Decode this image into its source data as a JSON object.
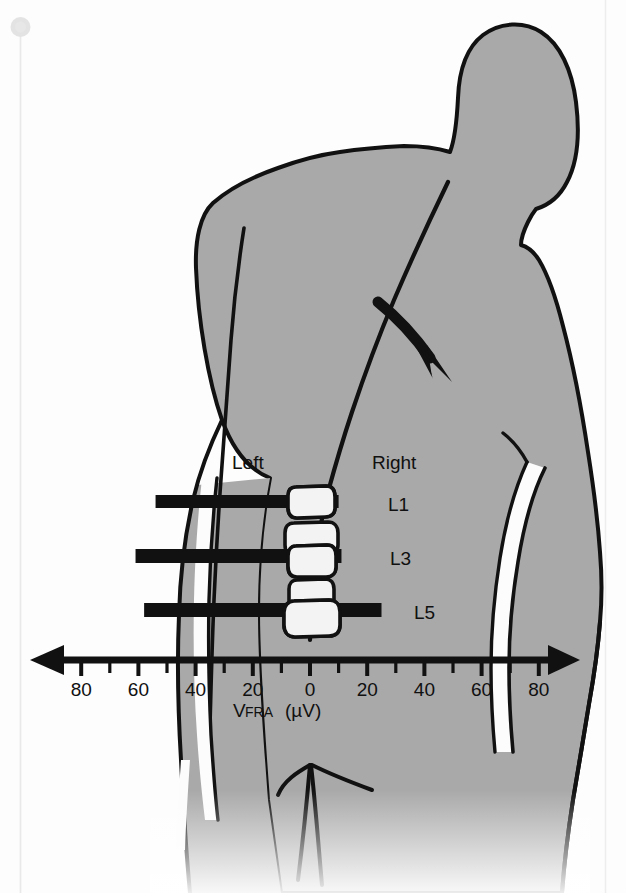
{
  "figure": {
    "kind": "anatomical-diagram-with-bar-chart",
    "body_fill": "#a9a9a9",
    "outline_color": "#111111",
    "vertebra_fill": "#f2f2f2",
    "bar_color": "#111111",
    "background": "#fdfdfd"
  },
  "labels": {
    "left": "Left",
    "right": "Right",
    "segments": [
      "L1",
      "L3",
      "L5"
    ]
  },
  "axis": {
    "title_main": "V",
    "title_sub": "FRA",
    "title_unit": "(µV)",
    "title_full": "VFRA (µV)",
    "tick_labels": [
      "80",
      "60",
      "40",
      "20",
      "0",
      "20",
      "40",
      "60",
      "80"
    ],
    "minor_tick_step": 10,
    "major_tick_step": 20
  },
  "chart_data": {
    "type": "bar",
    "orientation": "horizontal",
    "title": "",
    "xlabel": "VFRA (µV)",
    "ylabel": "",
    "xlim": [
      -90,
      90
    ],
    "xtick_values": [
      -80,
      -60,
      -40,
      -20,
      0,
      20,
      40,
      60,
      80
    ],
    "xtick_labels": [
      "80",
      "60",
      "40",
      "20",
      "0",
      "20",
      "40",
      "60",
      "80"
    ],
    "grid": false,
    "legend": false,
    "axis_note": "Bidirectional axis: magnitudes increase to the left (Left side) and to the right (Right side) from 0 at centre",
    "categories": [
      "L1",
      "L3",
      "L5"
    ],
    "series": [
      {
        "name": "Left",
        "values": [
          54,
          61,
          58
        ]
      },
      {
        "name": "Right",
        "values": [
          10,
          11,
          25
        ]
      }
    ],
    "bars": [
      {
        "label": "L1",
        "left_extent": 54,
        "right_extent": 10
      },
      {
        "label": "L3",
        "left_extent": 61,
        "right_extent": 11
      },
      {
        "label": "L5",
        "left_extent": 58,
        "right_extent": 25
      }
    ]
  },
  "annotations": {
    "arrow": "curved-arrow-pointing-down-right",
    "vertebrae_count": 5
  }
}
